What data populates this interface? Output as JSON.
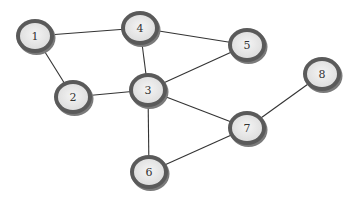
{
  "diagram": {
    "type": "undirected-graph",
    "node_style": {
      "fill": "#ececec",
      "stroke": "#555555",
      "shadow": "#7a7a7a",
      "rx": 19,
      "ry": 17
    },
    "edge_color": "#333333",
    "nodes": [
      {
        "id": "1",
        "label": "1",
        "x": 35,
        "y": 36
      },
      {
        "id": "2",
        "label": "2",
        "x": 73,
        "y": 97
      },
      {
        "id": "3",
        "label": "3",
        "x": 148,
        "y": 90
      },
      {
        "id": "4",
        "label": "4",
        "x": 140,
        "y": 28
      },
      {
        "id": "5",
        "label": "5",
        "x": 247,
        "y": 45
      },
      {
        "id": "6",
        "label": "6",
        "x": 149,
        "y": 172
      },
      {
        "id": "7",
        "label": "7",
        "x": 247,
        "y": 128
      },
      {
        "id": "8",
        "label": "8",
        "x": 322,
        "y": 74
      }
    ],
    "edges": [
      {
        "from": "1",
        "to": "4"
      },
      {
        "from": "1",
        "to": "2"
      },
      {
        "from": "2",
        "to": "3"
      },
      {
        "from": "4",
        "to": "3"
      },
      {
        "from": "4",
        "to": "5"
      },
      {
        "from": "3",
        "to": "5"
      },
      {
        "from": "3",
        "to": "7"
      },
      {
        "from": "3",
        "to": "6"
      },
      {
        "from": "6",
        "to": "7"
      },
      {
        "from": "7",
        "to": "8"
      }
    ]
  }
}
